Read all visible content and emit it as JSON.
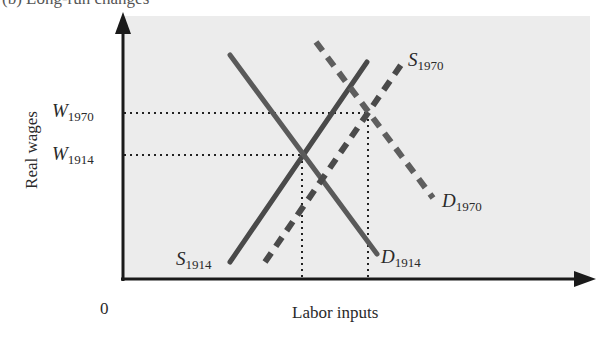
{
  "figure": {
    "title_partial": "(b) Long-run changes",
    "y_axis_label": "Real wages",
    "x_axis_label": "Labor inputs",
    "origin_label": "0",
    "colors": {
      "plot_background": "#ececec",
      "axis": "#1a1a1a",
      "curve_1914": "#555555",
      "curve_1970": "#606060",
      "guide": "#222222"
    }
  },
  "y_ticks": [
    {
      "letter": "W",
      "sub": "1970",
      "y": 113
    },
    {
      "letter": "W",
      "sub": "1914",
      "y": 155
    }
  ],
  "curves": [
    {
      "id": "S1914",
      "letter": "S",
      "sub": "1914",
      "style": "solid",
      "from": [
        230,
        262
      ],
      "to": [
        367,
        62
      ]
    },
    {
      "id": "D1914",
      "letter": "D",
      "sub": "1914",
      "style": "solid",
      "from": [
        230,
        55
      ],
      "to": [
        377,
        254
      ]
    },
    {
      "id": "S1970",
      "letter": "S",
      "sub": "1970",
      "style": "dashed",
      "from": [
        265,
        262
      ],
      "to": [
        403,
        62
      ]
    },
    {
      "id": "D1970",
      "letter": "D",
      "sub": "1970",
      "style": "dashed",
      "from": [
        316,
        42
      ],
      "to": [
        433,
        198
      ]
    }
  ],
  "equilibria": [
    {
      "year": "1914",
      "x": 302,
      "y": 155
    },
    {
      "year": "1970",
      "x": 368,
      "y": 113
    }
  ]
}
